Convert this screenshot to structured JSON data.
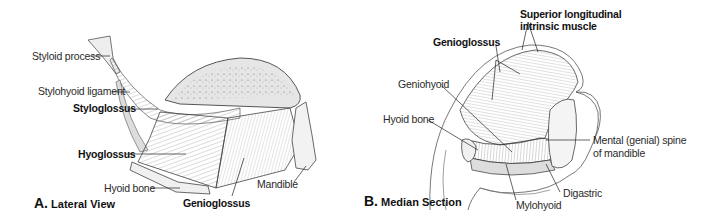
{
  "panels": [
    {
      "id": "A",
      "letter": "A.",
      "title": "Lateral View",
      "labels": [
        {
          "text": "Styloid process",
          "bold": false
        },
        {
          "text": "Stylohyoid ligament",
          "bold": false
        },
        {
          "text": "Styloglossus",
          "bold": true
        },
        {
          "text": "Hyoglossus",
          "bold": true
        },
        {
          "text": "Hyoid bone",
          "bold": false
        },
        {
          "text": "Genioglossus",
          "bold": true
        },
        {
          "text": "Mandible",
          "bold": false
        }
      ]
    },
    {
      "id": "B",
      "letter": "B.",
      "title": "Median Section",
      "labels": [
        {
          "text": "Superior longitudinal",
          "bold": true
        },
        {
          "text": "intrinsic muscle",
          "bold": true
        },
        {
          "text": "Genioglossus",
          "bold": true
        },
        {
          "text": "Geniohyoid",
          "bold": false
        },
        {
          "text": "Hyoid bone",
          "bold": false
        },
        {
          "text": "Mental (genial) spine",
          "bold": false
        },
        {
          "text": "of mandible",
          "bold": false
        },
        {
          "text": "Digastric",
          "bold": false
        },
        {
          "text": "Mylohyoid",
          "bold": false
        }
      ]
    }
  ]
}
